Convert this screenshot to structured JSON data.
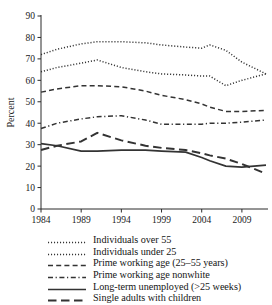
{
  "chart_data": {
    "type": "line",
    "title": "",
    "xlabel": "",
    "ylabel": "Percent",
    "xlim": [
      1984,
      2012
    ],
    "ylim": [
      0,
      90
    ],
    "ytick_labels": [
      "0",
      "10",
      "20",
      "30",
      "40",
      "50",
      "60",
      "70",
      "80",
      "90"
    ],
    "yticks": [
      0,
      10,
      20,
      30,
      40,
      50,
      60,
      70,
      80,
      90
    ],
    "xtick_labels": [
      "1984",
      "1989",
      "1994",
      "1999",
      "2004",
      "2009"
    ],
    "xticks": [
      1984,
      1989,
      1994,
      1999,
      2004,
      2009
    ],
    "grid": false,
    "legend_position": "below",
    "series": [
      {
        "name": "Individuals over 55",
        "style": "dotted",
        "x": [
          1984,
          1986,
          1989,
          1991,
          1994,
          1997,
          1999,
          2002,
          2004,
          2005,
          2007,
          2009,
          2012
        ],
        "values": [
          72,
          74.5,
          77,
          78,
          78,
          77.5,
          76.5,
          75.5,
          75,
          76.5,
          74,
          68.5,
          63
        ]
      },
      {
        "name": "Individuals under 25",
        "style": "dotted",
        "x": [
          1984,
          1986,
          1989,
          1991,
          1994,
          1997,
          1999,
          2002,
          2004,
          2005,
          2007,
          2009,
          2012
        ],
        "values": [
          64,
          66,
          68,
          69.5,
          66,
          64,
          63,
          62.5,
          62,
          62,
          57.5,
          60,
          63
        ]
      },
      {
        "name": "Prime working age (25–55 years)",
        "style": "dashed",
        "x": [
          1984,
          1986,
          1989,
          1991,
          1994,
          1997,
          1999,
          2002,
          2004,
          2005,
          2007,
          2009,
          2012
        ],
        "values": [
          54.5,
          56,
          57.5,
          57.5,
          57,
          55,
          53,
          51,
          49,
          47.5,
          45.5,
          45.5,
          46
        ]
      },
      {
        "name": "Prime working age nonwhite",
        "style": "dashdot",
        "x": [
          1984,
          1986,
          1989,
          1991,
          1994,
          1997,
          1999,
          2002,
          2004,
          2005,
          2007,
          2009,
          2012
        ],
        "values": [
          37.5,
          40,
          42,
          43,
          43.5,
          41.5,
          39.5,
          39.5,
          39.5,
          40,
          40,
          40.5,
          41.5
        ]
      },
      {
        "name": "Long-term unemployed (>25 weeks)",
        "style": "solid",
        "x": [
          1984,
          1986,
          1989,
          1991,
          1994,
          1997,
          1999,
          2002,
          2004,
          2005,
          2007,
          2009,
          2012
        ],
        "values": [
          30.5,
          29.5,
          27,
          27,
          27.5,
          27.5,
          27,
          26.5,
          24,
          22.5,
          20,
          19.5,
          20.5
        ]
      },
      {
        "name": "Single adults with children",
        "style": "longdash",
        "x": [
          1984,
          1986,
          1989,
          1991,
          1994,
          1997,
          1999,
          2002,
          2004,
          2005,
          2007,
          2009,
          2012
        ],
        "values": [
          27.5,
          29.5,
          31.5,
          35.5,
          32,
          29.5,
          28.5,
          27.5,
          26,
          25,
          23.5,
          21,
          16.5
        ]
      }
    ]
  },
  "legend": {
    "items": [
      {
        "label": "Individuals over 55",
        "style": "dotted"
      },
      {
        "label": "Individuals under 25",
        "style": "dotted"
      },
      {
        "label": "Prime working age (25–55 years)",
        "style": "dashed"
      },
      {
        "label": "Prime working age nonwhite",
        "style": "dashdot"
      },
      {
        "label": "Long-term unemployed (>25 weeks)",
        "style": "solid"
      },
      {
        "label": "Single adults with children",
        "style": "longdash"
      }
    ]
  },
  "colors": {
    "line": "#333333",
    "axis": "#2b2b2b",
    "text": "#151515",
    "background": "#ffffff"
  }
}
